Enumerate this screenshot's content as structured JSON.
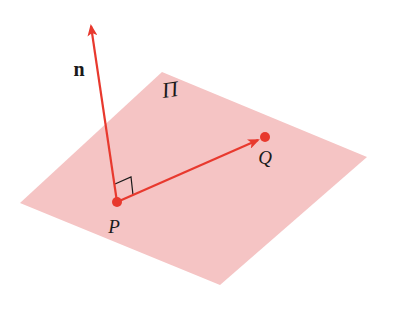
{
  "diagram": {
    "type": "geometry-plane-normal",
    "colors": {
      "plane_fill": "#f5c4c4",
      "vector": "#e8392e",
      "point": "#e8392e",
      "right_angle_marker": "#1a1a1a",
      "label": "#1a1a1a"
    },
    "plane": {
      "label": "Π",
      "vertices": [
        [
          162,
          72
        ],
        [
          367,
          157
        ],
        [
          220,
          285
        ],
        [
          20,
          203
        ]
      ],
      "label_pos": [
        170,
        97
      ]
    },
    "points": [
      {
        "id": "P",
        "label": "P",
        "pos": [
          117,
          202
        ],
        "label_pos": [
          112,
          233
        ]
      },
      {
        "id": "Q",
        "label": "Q",
        "pos": [
          265,
          137
        ],
        "label_pos": [
          262,
          164
        ]
      }
    ],
    "vectors": [
      {
        "id": "n",
        "label": "n",
        "from": [
          117,
          202
        ],
        "to": [
          91,
          26
        ],
        "label_pos": [
          79,
          76
        ]
      },
      {
        "id": "PQ",
        "label": "",
        "from": [
          117,
          202
        ],
        "to": [
          258,
          140
        ]
      }
    ],
    "right_angle": {
      "at": "P",
      "between": [
        "n",
        "PQ"
      ]
    }
  }
}
